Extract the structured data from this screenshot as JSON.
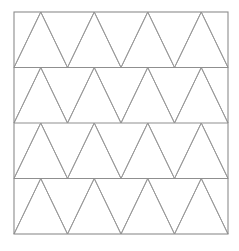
{
  "figure": {
    "kind": "geometric-pattern",
    "name": "triangular-tessellation",
    "background_color": "#ffffff"
  },
  "canvas": {
    "width": 239,
    "height": 251
  },
  "square": {
    "left": 14,
    "top": 12,
    "right": 228,
    "bottom": 234,
    "width": 214,
    "height": 222,
    "stroke_color": "#8c8c8c",
    "stroke_width": 1.1,
    "fill": "none"
  },
  "lattice": {
    "rows": 4,
    "columns": 4,
    "row_height": 55.5,
    "triangle_base": 53.5,
    "triangle_half_base": 26.75,
    "diagonal_stroke_color": "#9a9a9a",
    "diagonal_stroke_width": 1,
    "horizontal_stroke_color": "#8f8f8f",
    "horizontal_stroke_width": 1,
    "horizontal_line_y": [
      12,
      67.5,
      123,
      178.5,
      234
    ],
    "row_phase_offset": [
      0.5,
      0.5,
      0.5,
      0.5
    ],
    "apex_x_top_edge": [
      67.5,
      121,
      174.5
    ],
    "apex_x_bottom_edge": [
      67.5,
      121,
      174.5
    ],
    "vertex_x_even": [
      14,
      67.5,
      121,
      174.5,
      228
    ],
    "vertex_x_odd": [
      14,
      40.75,
      94.25,
      147.75,
      201.25,
      228
    ]
  },
  "chart_data": {
    "type": "scatter",
    "title": "",
    "xlabel": "",
    "ylabel": "",
    "grid": true,
    "legend": "none",
    "xlim": [
      14,
      228
    ],
    "ylim": [
      12,
      234
    ],
    "horizontal_lines_y": [
      12,
      67.5,
      123,
      178.5,
      234
    ],
    "triangle_rows": 4,
    "triangles_per_row": 8,
    "total_triangles": 32
  }
}
